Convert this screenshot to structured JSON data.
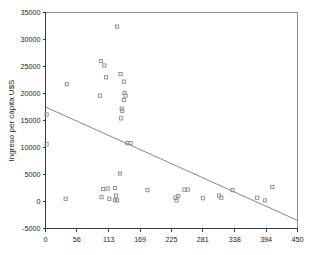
{
  "chart_data": {
    "type": "scatter",
    "title": "",
    "xlabel": "",
    "ylabel": "Ingreso per cápita U$S",
    "xlim": [
      0,
      450
    ],
    "ylim": [
      -5000,
      35000
    ],
    "xticks": [
      0,
      56,
      113,
      169,
      225,
      281,
      338,
      394,
      450
    ],
    "xtick_labels": [
      "0",
      "56",
      "113",
      "169",
      "225",
      "281",
      "338",
      "394",
      "450"
    ],
    "yticks": [
      -5000,
      0,
      5000,
      10000,
      15000,
      20000,
      25000,
      30000,
      35000
    ],
    "ytick_labels": [
      "-5000",
      "0",
      "5000",
      "10000",
      "15000",
      "20000",
      "25000",
      "30000",
      "35000"
    ],
    "grid": false,
    "legend": false,
    "marker_style": "open-square",
    "marker_color": "#8a8a8a",
    "series": [
      {
        "name": "observations",
        "points": [
          [
            2,
            16100
          ],
          [
            2,
            10600
          ],
          [
            38,
            21700
          ],
          [
            36,
            500
          ],
          [
            97,
            19600
          ],
          [
            99,
            26000
          ],
          [
            105,
            25200
          ],
          [
            108,
            23000
          ],
          [
            128,
            32400
          ],
          [
            134,
            23600
          ],
          [
            140,
            22200
          ],
          [
            141,
            20100
          ],
          [
            143,
            19600
          ],
          [
            140,
            18800
          ],
          [
            136,
            17200
          ],
          [
            137,
            16800
          ],
          [
            135,
            15400
          ],
          [
            146,
            10800
          ],
          [
            152,
            10800
          ],
          [
            133,
            5200
          ],
          [
            103,
            2300
          ],
          [
            111,
            2400
          ],
          [
            124,
            2500
          ],
          [
            100,
            800
          ],
          [
            114,
            500
          ],
          [
            124,
            300
          ],
          [
            126,
            1100
          ],
          [
            128,
            200
          ],
          [
            182,
            2100
          ],
          [
            232,
            700
          ],
          [
            234,
            200
          ],
          [
            237,
            1000
          ],
          [
            248,
            2200
          ],
          [
            254,
            2200
          ],
          [
            281,
            600
          ],
          [
            310,
            1100
          ],
          [
            314,
            700
          ],
          [
            334,
            2100
          ],
          [
            378,
            700
          ],
          [
            392,
            200
          ],
          [
            405,
            2700
          ]
        ]
      }
    ],
    "fit_line": {
      "name": "regression-line",
      "x0": 0,
      "y0": 17500,
      "x1": 450,
      "y1": -3500,
      "color": "#7a7a7a"
    }
  }
}
